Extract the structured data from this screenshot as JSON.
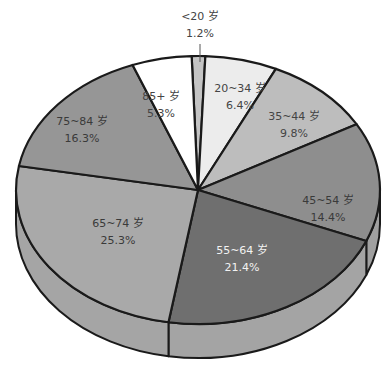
{
  "chart_data": {
    "type": "pie",
    "title": "",
    "style": "3d-pie",
    "start_angle_deg": -92,
    "direction": "clockwise",
    "categories": [
      "<20 岁",
      "20~34 岁",
      "35~44 岁",
      "45~54 岁",
      "55~64 岁",
      "65~74 岁",
      "75~84 岁",
      "85+ 岁"
    ],
    "values": [
      1.2,
      6.4,
      9.8,
      14.4,
      21.4,
      25.3,
      16.3,
      5.3
    ],
    "value_labels": [
      "1.2%",
      "6.4%",
      "9.8%",
      "14.4%",
      "21.4%",
      "25.3%",
      "16.3%",
      "5.3%"
    ],
    "colors": [
      "#c4c4c4",
      "#ececec",
      "#bdbdbd",
      "#8e8e8e",
      "#6f6f6f",
      "#a9a9a9",
      "#969696",
      "#ffffff"
    ],
    "side_colors": [
      "#b0b0b0",
      "#d4d4d4",
      "#a8a8a8",
      "#a0a0a0",
      "#a4a4a4",
      "#a5a5a5",
      "#8a8a8a",
      "#e8e8e8"
    ],
    "label_colors": [
      "#444444",
      "#444444",
      "#444444",
      "#3a3a3a",
      "#f2f2f2",
      "#3a3a3a",
      "#3a3a3a",
      "#444444"
    ],
    "label_positions": [
      [
        200,
        20
      ],
      [
        240,
        92
      ],
      [
        294,
        120
      ],
      [
        328,
        204
      ],
      [
        242,
        254
      ],
      [
        118,
        227
      ],
      [
        82,
        125
      ],
      [
        161,
        100
      ]
    ],
    "leader_line": {
      "category": "<20 岁",
      "from": [
        200,
        44
      ],
      "to": [
        200,
        62
      ]
    },
    "geometry": {
      "cx": 198,
      "cy": 190,
      "rx": 182,
      "ry": 134,
      "depth": 34
    },
    "legend": "none"
  }
}
